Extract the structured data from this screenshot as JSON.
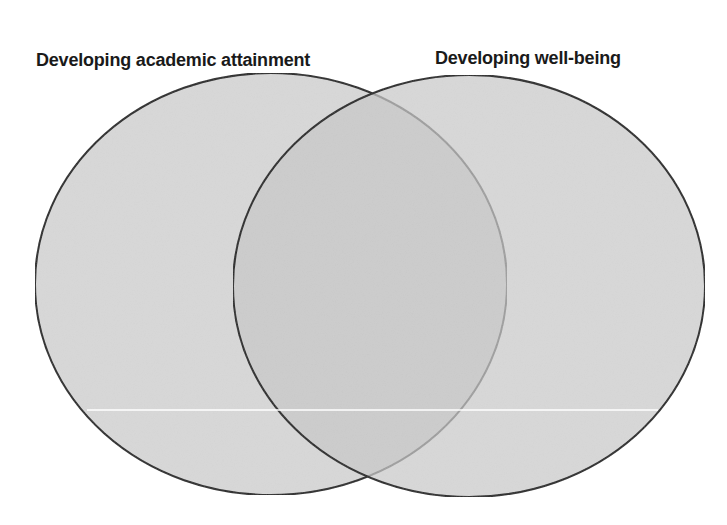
{
  "diagram": {
    "type": "venn",
    "sets": [
      {
        "id": "left",
        "label": "Developing academic attainment",
        "cx": 271,
        "cy": 284,
        "rx": 236,
        "ry": 211
      },
      {
        "id": "right",
        "label": "Developing well-being",
        "cx": 469,
        "cy": 286,
        "rx": 236,
        "ry": 211
      }
    ],
    "colors": {
      "fill": "#c8c8c8",
      "fill_opacity": 0.72,
      "stroke": "#2a2a2a",
      "background": "#ffffff",
      "artifact_line": "#ffffff"
    },
    "artifact_line": {
      "x1": 87,
      "x2": 658,
      "y": 410
    }
  }
}
